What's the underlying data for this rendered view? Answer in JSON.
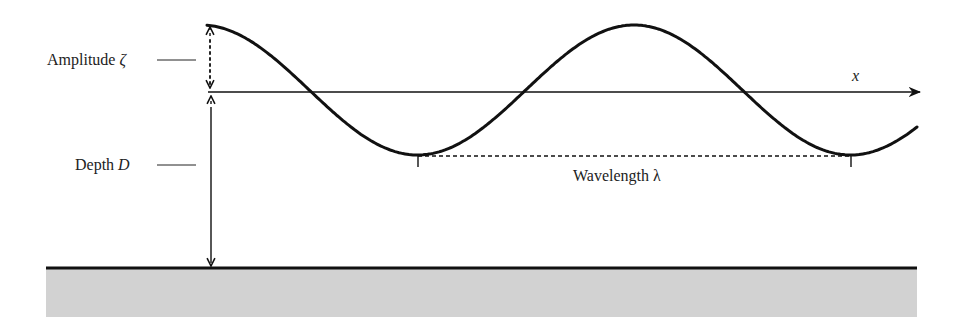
{
  "diagram": {
    "labels": {
      "amplitude": "Amplitude",
      "amplitude_symbol": "ζ",
      "depth": "Depth",
      "depth_symbol": "D",
      "wavelength": "Wavelength",
      "wavelength_symbol": "λ",
      "x_axis": "x"
    },
    "colors": {
      "line": "#111111",
      "text": "#222222",
      "seabed_fill": "#d2d2d2"
    },
    "geometry": {
      "wave": {
        "x_start": 207,
        "x_end": 918,
        "mean_y": 90,
        "amplitude_px": 65,
        "wavelength_px": 433,
        "crest_x": 634
      },
      "axis": {
        "x_start": 208,
        "x_end": 922,
        "y": 92
      },
      "seabed": {
        "x_start": 46,
        "x_end": 917,
        "y": 268,
        "bottom": 317
      },
      "trough_ticks": [
        418,
        851
      ],
      "wavelength_line": {
        "x1": 418,
        "x2": 851,
        "y": 156
      },
      "measure_x": 210
    }
  }
}
